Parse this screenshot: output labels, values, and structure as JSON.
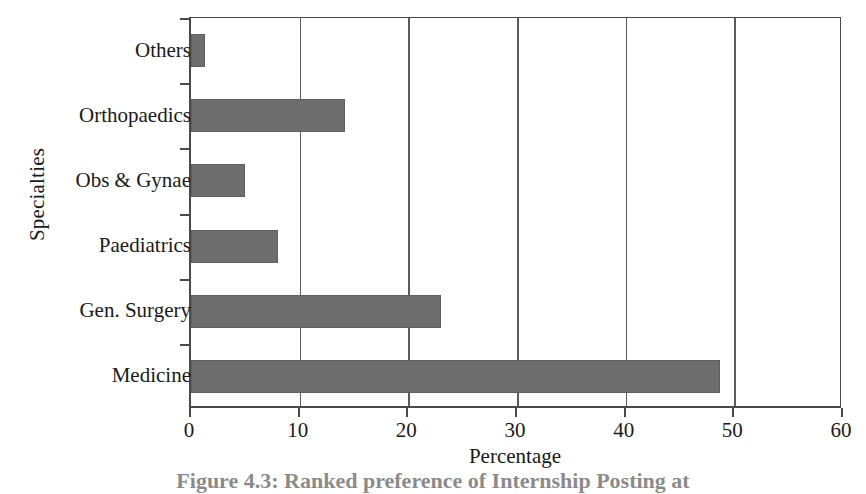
{
  "chart_data": {
    "type": "bar",
    "orientation": "horizontal",
    "title": "",
    "xlabel": "Percentage",
    "ylabel": "Specialties",
    "categories": [
      "Medicine",
      "Gen. Surgery",
      "Paediatrics",
      "Obs & Gynae",
      "Orthopaedics",
      "Others"
    ],
    "values": [
      48.7,
      23.0,
      8.0,
      5.0,
      14.2,
      1.3
    ],
    "xlim": [
      0,
      60
    ],
    "xticks": [
      0,
      10,
      20,
      30,
      40,
      50,
      60
    ],
    "xtick_labels": [
      "0",
      "10",
      "20",
      "30",
      "40",
      "50",
      "60"
    ],
    "gridlines": [
      10,
      20,
      30,
      40,
      50
    ],
    "grid": true,
    "legend": "none",
    "bar_color": "#6e6e6e",
    "axis_color": "#4a4a4a",
    "background": "#ffffff"
  },
  "caption": {
    "text": "Figure 4.3:  Ranked preference of Internship Posting at"
  }
}
